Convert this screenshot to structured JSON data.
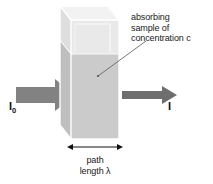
{
  "figure": {
    "background_color": "#ffffff"
  },
  "labels": {
    "callout": {
      "line1": "absorbing",
      "line2": "sample of",
      "line3": "concentration c"
    },
    "path_length": {
      "line1": "path",
      "line2": "length λ"
    },
    "incident_beam": {
      "symbol": "I",
      "subscript": "0"
    },
    "transmitted_beam": {
      "symbol": "I"
    }
  },
  "colors": {
    "arrow_incident": "#808080",
    "arrow_transmitted": "#6e6e6e",
    "cuvette_front_empty": "#e8e8e8",
    "cuvette_front_filled": "#c9c9c9",
    "cuvette_side_empty": "#dcdcdc",
    "cuvette_side_filled": "#bdbdbd",
    "cuvette_top": "#f0f0f0",
    "cuvette_edge": "#ffffff",
    "leader_line": "#555555",
    "dimension_arrow": "#111111",
    "text": "#1a1a1a"
  },
  "geometry": {
    "cuvette_front_left_x": 71,
    "cuvette_front_right_x": 119,
    "cuvette_front_top_y": 20,
    "cuvette_front_bottom_y": 139,
    "fill_level_y": 54,
    "depth_dx": -11,
    "depth_dy": -14,
    "dimension_line_y": 147
  }
}
